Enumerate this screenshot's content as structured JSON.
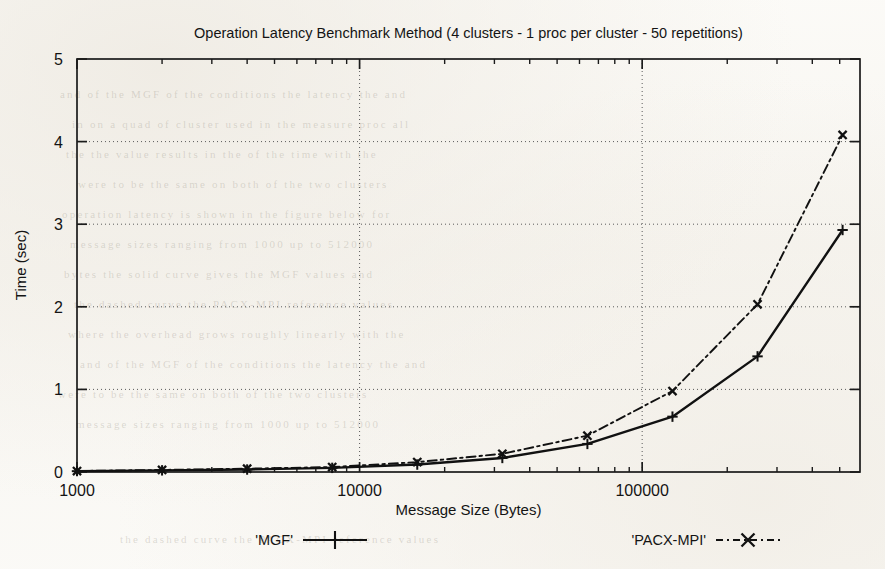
{
  "chart_data": {
    "type": "line",
    "title": "Operation Latency Benchmark Method (4 clusters - 1 proc per cluster - 50 repetitions)",
    "xlabel": "Message Size (Bytes)",
    "ylabel": "Time (sec)",
    "xscale": "log",
    "yscale": "linear",
    "xlim": [
      1000,
      590000
    ],
    "ylim": [
      0,
      5
    ],
    "grid": true,
    "grid_style": "dotted",
    "legend_position": "below-plot",
    "x_tick_labels": [
      "1000",
      "10000",
      "100000"
    ],
    "x_tick_values": [
      1000,
      10000,
      100000
    ],
    "y_tick_labels": [
      "0",
      "1",
      "2",
      "3",
      "4",
      "5"
    ],
    "y_tick_values": [
      0,
      1,
      2,
      3,
      4,
      5
    ],
    "x": [
      1000,
      2000,
      4000,
      8000,
      16000,
      32000,
      64000,
      128000,
      256000,
      512000
    ],
    "series": [
      {
        "name": "'MGF'",
        "marker": "plus",
        "line_style": "solid",
        "color": "#111111",
        "values": [
          0.01,
          0.02,
          0.03,
          0.05,
          0.09,
          0.17,
          0.34,
          0.67,
          1.4,
          2.93
        ]
      },
      {
        "name": "'PACX-MPI'",
        "marker": "cross",
        "line_style": "dash-dot",
        "color": "#111111",
        "values": [
          0.012,
          0.025,
          0.04,
          0.06,
          0.12,
          0.22,
          0.44,
          0.98,
          2.03,
          4.08
        ]
      }
    ]
  },
  "figure": {
    "title": "Operation Latency Benchmark Method (4 clusters - 1 proc per cluster - 50 repetitions)",
    "x_axis_title": "Message Size (Bytes)",
    "y_axis_title": "Time (sec)",
    "legend": [
      {
        "label": "'MGF'",
        "style": "solid-plus"
      },
      {
        "label": "'PACX-MPI'",
        "style": "dashdot-cross"
      }
    ]
  },
  "background_ghost_lines": [
    "and of the MGF  of the conditions  the latency the and",
    "in on a quad of  cluster  used in the measure  proc all",
    "the the value  results  in the  of the  time  with  the",
    "were to be the  same  on  both  of  the  two  clusters",
    "operation  latency  is  shown  in  the  figure  below  for",
    "message  sizes  ranging  from  1000  up  to  512000",
    "bytes  the  solid  curve  gives  the  MGF  values  and",
    "the  dashed  curve  the  PACX-MPI  reference  values",
    "where  the  overhead  grows  roughly  linearly  with  the"
  ]
}
